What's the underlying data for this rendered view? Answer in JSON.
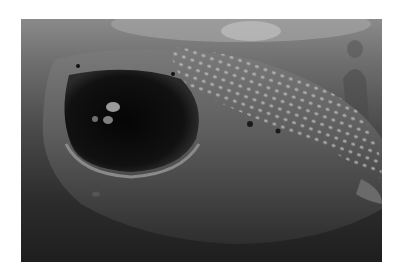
{
  "image": {
    "subject": "Whale shark with open mouth swimming toward camera, diver in background",
    "style": "grayscale underwater photograph",
    "elements": [
      {
        "name": "whale-shark",
        "description": "spotted whale shark head, mouth wide open"
      },
      {
        "name": "remora-fish",
        "description": "small fish inside the shark's mouth"
      },
      {
        "name": "diver",
        "description": "snorkeler/diver in upper right"
      },
      {
        "name": "water-surface",
        "description": "light rippled surface at top"
      }
    ],
    "colors": {
      "background": "#ffffff",
      "water_top": "#8a8a8a",
      "water_bottom": "#1e1e1e",
      "shark_skin": "#5a5a5a",
      "spots": "#c8c8c8",
      "mouth": "#0a0a0a"
    }
  }
}
